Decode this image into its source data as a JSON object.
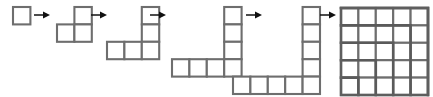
{
  "figure": {
    "title": "Square numbers built from gnomons",
    "description": "A left-to-right sequence of six grid figures joined by arrows, showing successive gnomon (L-shaped) layers accumulating into a 5 by 5 square.",
    "background_color": "#ffffff",
    "cell_stroke_color": "#6e6e6e",
    "gnomon_stroke_color": "#5a5a5a",
    "arrow_color": "#111111",
    "cell_fill_color": "#ffffff",
    "cell_size_px": 17.4,
    "stage_count": 6,
    "arrow_count": 5
  },
  "chart_data": {
    "type": "diagram",
    "title": "Square numbers built from gnomons",
    "sequence_name": "Square numbers",
    "categories": [
      "Stage 1",
      "Stage 2",
      "Stage 3",
      "Stage 4",
      "Stage 5",
      "Stage 6"
    ],
    "values": [
      1,
      4,
      9,
      16,
      25,
      25
    ],
    "gnomon_added": [
      1,
      3,
      5,
      7,
      9,
      0
    ],
    "side_lengths": [
      1,
      2,
      3,
      4,
      5,
      5
    ],
    "stages": [
      {
        "index": 1,
        "label": "1",
        "side": 1,
        "cell_count": 1,
        "shape": "single-square",
        "x": 13,
        "y": 7,
        "cols": 1,
        "rows": 1,
        "cells": [
          [
            0,
            0
          ]
        ],
        "gnomon_layers": []
      },
      {
        "index": 2,
        "label": "4",
        "side": 2,
        "cell_count": 3,
        "shape": "L-gnomon",
        "x": 57,
        "y": 7,
        "cols": 2,
        "rows": 2,
        "cells": [
          [
            1,
            0
          ],
          [
            0,
            1
          ],
          [
            1,
            1
          ]
        ],
        "gnomon_layers": []
      },
      {
        "index": 3,
        "label": "9",
        "side": 3,
        "cell_count": 5,
        "shape": "L-gnomon",
        "x": 107,
        "y": 7,
        "cols": 3,
        "rows": 3,
        "cells": [
          [
            2,
            0
          ],
          [
            2,
            1
          ],
          [
            0,
            2
          ],
          [
            1,
            2
          ],
          [
            2,
            2
          ]
        ],
        "gnomon_layers": []
      },
      {
        "index": 4,
        "label": "16",
        "side": 4,
        "cell_count": 7,
        "shape": "L-gnomon",
        "x": 172,
        "y": 7,
        "cols": 4,
        "rows": 4,
        "cells": [
          [
            3,
            0
          ],
          [
            3,
            1
          ],
          [
            3,
            2
          ],
          [
            0,
            3
          ],
          [
            1,
            3
          ],
          [
            2,
            3
          ],
          [
            3,
            3
          ]
        ],
        "gnomon_layers": []
      },
      {
        "index": 5,
        "label": "25",
        "side": 5,
        "cell_count": 9,
        "shape": "L-gnomon",
        "x": 233,
        "y": 7,
        "cols": 5,
        "rows": 5,
        "cells": [
          [
            4,
            0
          ],
          [
            4,
            1
          ],
          [
            4,
            2
          ],
          [
            4,
            3
          ],
          [
            0,
            4
          ],
          [
            1,
            4
          ],
          [
            2,
            4
          ],
          [
            3,
            4
          ],
          [
            4,
            4
          ]
        ],
        "gnomon_layers": []
      },
      {
        "index": 6,
        "label": "25",
        "side": 5,
        "cell_count": 25,
        "shape": "full-square",
        "x": 341,
        "y": 8,
        "cols": 5,
        "rows": 5,
        "cells": [],
        "gnomon_layers": [
          1,
          2,
          3,
          4,
          5
        ]
      }
    ],
    "arrows": [
      {
        "index": 1,
        "x": 34,
        "y": 15,
        "length": 16,
        "direction": "right"
      },
      {
        "index": 2,
        "x": 91,
        "y": 15,
        "length": 16,
        "direction": "right"
      },
      {
        "index": 3,
        "x": 150,
        "y": 15,
        "length": 16,
        "direction": "right"
      },
      {
        "index": 4,
        "x": 246,
        "y": 15,
        "length": 16,
        "direction": "right"
      },
      {
        "index": 5,
        "x": 320,
        "y": 15,
        "length": 16,
        "direction": "right"
      }
    ]
  }
}
